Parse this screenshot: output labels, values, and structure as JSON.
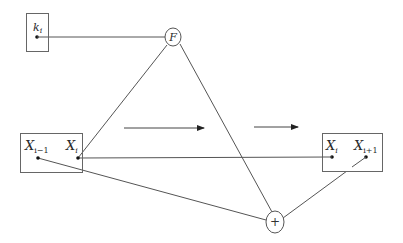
{
  "diagram": {
    "type": "block-diagram",
    "colors": {
      "stroke": "#555555",
      "dot": "#111111",
      "text": "#2a2a2a",
      "background": "#ffffff"
    },
    "key_box": {
      "label_main": "k",
      "label_sub": "i"
    },
    "f_node": {
      "label": "F"
    },
    "xor_node": {
      "label": "+"
    },
    "left_box": {
      "left_label_main": "X",
      "left_label_sub": "i−1",
      "right_label_main": "X",
      "right_label_sub": "i"
    },
    "right_box": {
      "left_label_main": "X",
      "left_label_sub": "i",
      "right_label_main": "X",
      "right_label_sub": "i+1"
    },
    "arrows": [
      {
        "direction": "right"
      },
      {
        "direction": "right"
      }
    ],
    "edges": [
      {
        "from": "k_i",
        "to": "F"
      },
      {
        "from": "X_i (left box)",
        "to": "F"
      },
      {
        "from": "F",
        "to": "+"
      },
      {
        "from": "X_i (left box)",
        "to": "X_i (right box)"
      },
      {
        "from": "X_{i-1}",
        "to": "+"
      },
      {
        "from": "+",
        "to": "X_{i+1}"
      }
    ]
  }
}
